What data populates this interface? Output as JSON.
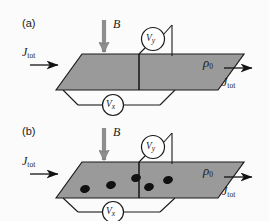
{
  "figure": {
    "background_color": "#fbfbfb",
    "slab_fill": "#9a9a9a",
    "stroke_color": "#1a1a1a",
    "dot_color": "#111111"
  },
  "panels": [
    {
      "id": "a",
      "label": "(a)",
      "field_label": "B",
      "field_direction": "down",
      "current_in_label": "J",
      "current_in_sub": "tot",
      "current_out_label": "J",
      "current_out_sub": "tot",
      "resistivity_label": "ρ",
      "resistivity_sub": "0",
      "meter_y_label": "V",
      "meter_y_sub": "y",
      "meter_x_label": "V",
      "meter_x_sub": "x",
      "dots": []
    },
    {
      "id": "b",
      "label": "(b)",
      "field_label": "B",
      "field_direction": "down",
      "current_in_label": "J",
      "current_in_sub": "tot",
      "current_out_label": "J",
      "current_out_sub": "tot",
      "resistivity_label": "ρ",
      "resistivity_sub": "0",
      "meter_y_label": "V",
      "meter_y_sub": "y",
      "meter_x_label": "V",
      "meter_x_sub": "x",
      "dots": [
        {
          "cx": 85,
          "cy": 189,
          "rx": 5.0,
          "ry": 4.0,
          "rot": -18
        },
        {
          "cx": 111,
          "cy": 185,
          "rx": 5.0,
          "ry": 4.0,
          "rot": -18
        },
        {
          "cx": 136,
          "cy": 178,
          "rx": 5.0,
          "ry": 4.0,
          "rot": -18
        },
        {
          "cx": 149,
          "cy": 187,
          "rx": 5.0,
          "ry": 4.0,
          "rot": -18
        },
        {
          "cx": 168,
          "cy": 180,
          "rx": 5.0,
          "ry": 4.0,
          "rot": -18
        }
      ]
    }
  ]
}
